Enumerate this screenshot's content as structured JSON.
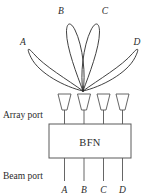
{
  "figure": {
    "background_color": "#ffffff",
    "line_color": "#2b2b2b",
    "box_stroke_color": "#5a5a5a"
  },
  "beams": {
    "description": "Four radiation pattern lobes emanating from a common phase center",
    "origin": {
      "x": 83,
      "y": 91
    },
    "lobes": [
      {
        "id": "A",
        "label": "A",
        "label_x": 23,
        "label_y": 45,
        "tip_x": 33,
        "tip_y": 52,
        "width": 13
      },
      {
        "id": "B",
        "label": "B",
        "label_x": 61,
        "label_y": 14,
        "tip_x": 66,
        "tip_y": 22,
        "width": 13
      },
      {
        "id": "C",
        "label": "C",
        "label_x": 104,
        "label_y": 14,
        "tip_x": 100,
        "tip_y": 22,
        "width": 13
      },
      {
        "id": "D",
        "label": "D",
        "label_x": 136,
        "label_y": 45,
        "tip_x": 132,
        "tip_y": 52,
        "width": 13
      }
    ]
  },
  "array": {
    "port_label": "Array port",
    "port_label_x": 3,
    "port_label_y": 118,
    "elements": [
      {
        "id": "element-1",
        "x": 64.5
      },
      {
        "id": "element-2",
        "x": 84.0
      },
      {
        "id": "element-3",
        "x": 103.5
      },
      {
        "id": "element-4",
        "x": 122.5
      }
    ],
    "horn": {
      "mouth_width": 13,
      "mouth_y": 94,
      "throat_y": 110,
      "throat_width": 5,
      "stem_y": 125
    }
  },
  "bfn": {
    "label": "BFN",
    "box": {
      "x": 49,
      "y": 124,
      "width": 82,
      "height": 34
    },
    "label_x": 90,
    "label_y": 146
  },
  "beam_ports": {
    "port_label": "Beam port",
    "port_label_x": 3,
    "port_label_y": 179,
    "stem_bottom_y": 181,
    "labels": [
      {
        "id": "beam-port-a",
        "label": "A",
        "x": 64.5
      },
      {
        "id": "beam-port-b",
        "label": "B",
        "x": 84.0
      },
      {
        "id": "beam-port-c",
        "label": "C",
        "x": 103.5
      },
      {
        "id": "beam-port-d",
        "label": "D",
        "x": 122.5
      }
    ],
    "label_y": 193
  }
}
